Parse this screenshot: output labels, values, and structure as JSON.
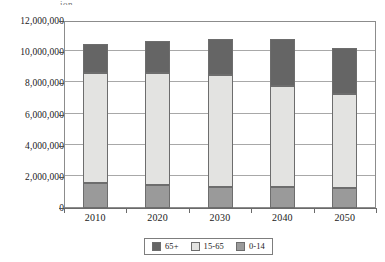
{
  "chart_data": {
    "type": "bar",
    "title": "",
    "xlabel": "",
    "ylabel": "",
    "stacked": true,
    "grid": true,
    "legend_position": "bottom",
    "categories": [
      "2010",
      "2020",
      "2030",
      "2040",
      "2050"
    ],
    "ylim": [
      0,
      12000000
    ],
    "ytick_values": [
      0,
      2000000,
      4000000,
      6000000,
      8000000,
      10000000,
      12000000
    ],
    "ytick_labels": [
      "0",
      "2,000,000",
      "4,000,000",
      "6,000,000",
      "8,000,000",
      "10,000,000",
      "12,000,000"
    ],
    "series": [
      {
        "name": "0-14",
        "color": "#9a9a9a",
        "values": [
          1600000,
          1480000,
          1350000,
          1350000,
          1280000
        ]
      },
      {
        "name": "15-65",
        "color": "#e3e3e1",
        "values": [
          7060000,
          7180000,
          7180000,
          6480000,
          6040000
        ]
      },
      {
        "name": "65+",
        "color": "#656565",
        "values": [
          1860000,
          2040000,
          2310000,
          3010000,
          2950000
        ]
      }
    ],
    "totals": [
      10520000,
      10700000,
      10840000,
      10840000,
      10270000
    ],
    "legend_order": [
      "65+",
      "15-65",
      "0-14"
    ]
  },
  "legend": {
    "items": [
      {
        "label": "65+",
        "color": "#656565",
        "icon": "legend-swatch-icon"
      },
      {
        "label": "15-65",
        "color": "#e3e3e1",
        "icon": "legend-swatch-icon"
      },
      {
        "label": "0-14",
        "color": "#9a9a9a",
        "icon": "legend-swatch-icon"
      }
    ]
  },
  "title_remnant": "ion",
  "colors": {
    "axis": "#6a6a6a",
    "grid": "#a8a8a8",
    "frame": "#8c8c8c",
    "background": "#ffffff",
    "segment_border": "#6d6d6d"
  }
}
